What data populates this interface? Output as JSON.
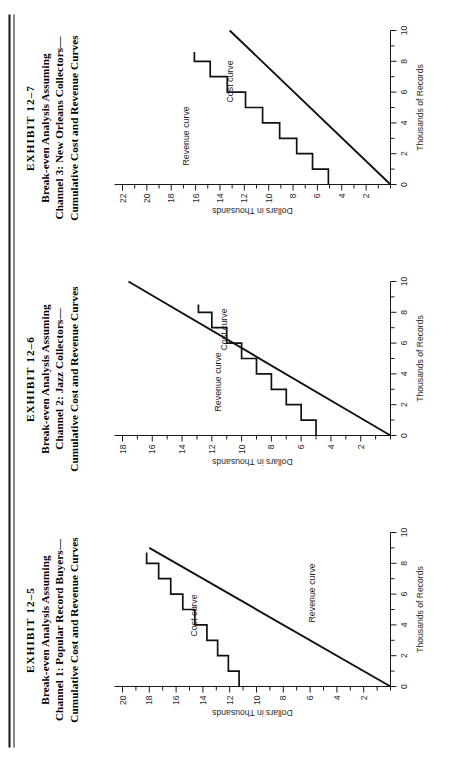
{
  "page": {
    "rule_label": "page-top-rule",
    "orientation": "rotated-90-ccw"
  },
  "panels": [
    {
      "exhibit": "EXHIBIT 12–5",
      "title_lines": [
        "Break-even Analysis Assuming",
        "Channel 1: Popular Record Buyers—",
        "Cumulative Cost and Revenue Curves"
      ],
      "cost_label": "Cost curve",
      "revenue_label": "Revenue curve"
    },
    {
      "exhibit": "EXHIBIT 12–6",
      "title_lines": [
        "Break-even Analysis Assuming",
        "Channel 2: Jazz Collectors—",
        "Cumulative Cost and Revenue Curves"
      ],
      "cost_label": "Cost curve",
      "revenue_label": "Revenue curve"
    },
    {
      "exhibit": "EXHIBIT 12–7",
      "title_lines": [
        "Break-even Analysis Assuming",
        "Channel 3: New Orleans Collectors—",
        "Cumulative Cost and Revenue Curves"
      ],
      "cost_label": "Cost curve",
      "revenue_label": "Revenue curve"
    }
  ],
  "chart_data": [
    {
      "type": "line",
      "title": "EXHIBIT 12-5 Break-even Analysis Assuming Channel 1: Popular Record Buyers—Cumulative Cost and Revenue Curves",
      "xlabel": "Thousands of Records",
      "ylabel": "Dollars in Thousands",
      "xlim": [
        0,
        10
      ],
      "ylim": [
        0,
        20
      ],
      "xticks": [
        0,
        1,
        2,
        3,
        4,
        5,
        6,
        7,
        8,
        9,
        10
      ],
      "xticklabels": [
        "0",
        "",
        "2",
        "",
        "4",
        "",
        "6",
        "",
        "8",
        "",
        "10"
      ],
      "yticks": [
        0,
        1,
        2,
        3,
        4,
        5,
        6,
        7,
        8,
        9,
        10,
        11,
        12,
        13,
        14,
        15,
        16,
        17,
        18,
        19,
        20
      ],
      "yticklabels": [
        "",
        "",
        "2",
        "",
        "4",
        "",
        "6",
        "",
        "8",
        "",
        "10",
        "",
        "12",
        "",
        "14",
        "",
        "16",
        "",
        "18",
        "",
        "20"
      ],
      "grid": false,
      "legend": "inline-annotations",
      "series": [
        {
          "name": "Cost curve",
          "style": "step",
          "x": [
            0.0,
            1.0,
            1.0,
            2.0,
            2.0,
            3.0,
            3.0,
            4.0,
            4.0,
            5.0,
            5.0,
            6.0,
            6.0,
            7.0,
            7.0,
            8.0,
            8.0,
            8.7
          ],
          "y": [
            11.3,
            11.3,
            12.1,
            12.1,
            12.9,
            12.9,
            13.7,
            13.7,
            14.6,
            14.6,
            15.5,
            15.5,
            16.4,
            16.4,
            17.3,
            17.3,
            18.2,
            18.2
          ]
        },
        {
          "name": "Revenue curve",
          "style": "linear",
          "x": [
            0.0,
            9.0
          ],
          "y": [
            0.0,
            18.0
          ]
        }
      ],
      "breakeven_point": {
        "x": 7.0,
        "y": 14.0
      }
    },
    {
      "type": "line",
      "title": "EXHIBIT 12-6 Break-even Analysis Assuming Channel 2: Jazz Collectors—Cumulative Cost and Revenue Curves",
      "xlabel": "Thousands of Records",
      "ylabel": "Dollars in Thousands",
      "xlim": [
        0,
        10
      ],
      "ylim": [
        0,
        18
      ],
      "xticks": [
        0,
        1,
        2,
        3,
        4,
        5,
        6,
        7,
        8,
        9,
        10
      ],
      "xticklabels": [
        "0",
        "",
        "2",
        "",
        "4",
        "",
        "6",
        "",
        "8",
        "",
        "10"
      ],
      "yticks": [
        0,
        1,
        2,
        3,
        4,
        5,
        6,
        7,
        8,
        9,
        10,
        11,
        12,
        13,
        14,
        15,
        16,
        17,
        18
      ],
      "yticklabels": [
        "",
        "",
        "2",
        "",
        "4",
        "",
        "6",
        "",
        "8",
        "",
        "10",
        "",
        "12",
        "",
        "14",
        "",
        "16",
        "",
        "18"
      ],
      "grid": false,
      "legend": "inline-annotations",
      "series": [
        {
          "name": "Cost curve",
          "style": "step",
          "x": [
            0.0,
            1.0,
            1.0,
            2.0,
            2.0,
            3.0,
            3.0,
            4.0,
            4.0,
            5.0,
            5.0,
            6.0,
            6.0,
            7.0,
            7.0,
            8.0,
            8.0,
            8.5
          ],
          "y": [
            5.0,
            5.0,
            6.0,
            6.0,
            7.0,
            7.0,
            8.0,
            8.0,
            9.0,
            9.0,
            10.0,
            10.0,
            11.0,
            11.0,
            12.0,
            12.0,
            12.9,
            12.9
          ]
        },
        {
          "name": "Revenue curve",
          "style": "linear",
          "x": [
            0.0,
            10.0
          ],
          "y": [
            0.0,
            17.6
          ]
        }
      ],
      "breakeven_point": {
        "x": 2.8,
        "y": 5.0
      }
    },
    {
      "type": "line",
      "title": "EXHIBIT 12-7 Break-even Analysis Assuming Channel 3: New Orleans Collectors—Cumulative Cost and Revenue Curves",
      "xlabel": "Thousands of Records",
      "ylabel": "Dollars in Thousands",
      "xlim": [
        0,
        10
      ],
      "ylim": [
        0,
        22
      ],
      "xticks": [
        0,
        1,
        2,
        3,
        4,
        5,
        6,
        7,
        8,
        9,
        10
      ],
      "xticklabels": [
        "0",
        "",
        "2",
        "",
        "4",
        "",
        "6",
        "",
        "8",
        "",
        "10"
      ],
      "yticks": [
        0,
        1,
        2,
        3,
        4,
        5,
        6,
        7,
        8,
        9,
        10,
        11,
        12,
        13,
        14,
        15,
        16,
        17,
        18,
        19,
        20,
        21,
        22
      ],
      "yticklabels": [
        "",
        "",
        "2",
        "",
        "4",
        "",
        "6",
        "",
        "8",
        "",
        "10",
        "",
        "12",
        "",
        "14",
        "",
        "16",
        "",
        "18",
        "",
        "20",
        "",
        "22"
      ],
      "grid": false,
      "legend": "inline-annotations",
      "series": [
        {
          "name": "Cost curve",
          "style": "step",
          "x": [
            0.0,
            1.0,
            1.0,
            2.0,
            2.0,
            3.0,
            3.0,
            4.0,
            4.0,
            5.0,
            5.0,
            6.0,
            6.0,
            7.0,
            7.0,
            8.0,
            8.0,
            8.6
          ],
          "y": [
            5.1,
            5.1,
            6.4,
            6.4,
            7.7,
            7.7,
            9.1,
            9.1,
            10.5,
            10.5,
            11.9,
            11.9,
            13.4,
            13.4,
            14.8,
            14.8,
            16.1,
            16.1
          ]
        },
        {
          "name": "Revenue curve",
          "style": "linear",
          "x": [
            0.0,
            10.0
          ],
          "y": [
            0.0,
            13.2
          ]
        }
      ],
      "breakeven_point": {
        "x": 3.8,
        "y": 5.1
      }
    }
  ]
}
